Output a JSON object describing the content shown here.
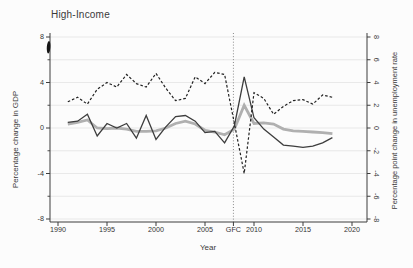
{
  "chart_data": {
    "type": "line",
    "title": "High-Income",
    "xlabel": "Year",
    "ylabel_left": "Percentage change in GDP",
    "ylabel_right": "Percentage point change in unemployment rate",
    "xlim": [
      1989.2,
      2021.5
    ],
    "ylim": [
      -8.4,
      8.4
    ],
    "x_ticks": [
      1990,
      1995,
      2000,
      2005,
      2010,
      2015,
      2020
    ],
    "y_ticks_left_labeled": [
      8,
      4,
      0,
      -4,
      -8
    ],
    "y_ticks_left_minor": [
      6,
      2,
      -2,
      -6
    ],
    "y_ticks_right": [
      8,
      6,
      4,
      2,
      0,
      -2,
      -4,
      -6,
      -8
    ],
    "grid_values": [
      8,
      6,
      4,
      2,
      0,
      -2,
      -4,
      -6,
      -8
    ],
    "grid": "on",
    "legend": "none",
    "event_line": {
      "label": "GFC",
      "x_position": 2007.9,
      "style": "dotted"
    },
    "x": [
      1991,
      1992,
      1993,
      1994,
      1995,
      1996,
      1997,
      1998,
      1999,
      2000,
      2001,
      2002,
      2003,
      2004,
      2005,
      2006,
      2007,
      2008,
      2009,
      2010,
      2011,
      2012,
      2013,
      2014,
      2015,
      2016,
      2017,
      2018
    ],
    "series": [
      {
        "id": "solid-gray-thick",
        "color": "#b0b0b0",
        "width": 2.8,
        "dash": null,
        "values": [
          0.35,
          0.5,
          0.7,
          0.0,
          -0.05,
          0.0,
          -0.1,
          -0.3,
          -0.3,
          -0.25,
          0.0,
          0.4,
          0.6,
          0.35,
          -0.2,
          -0.35,
          -0.6,
          -0.1,
          2.0,
          0.4,
          0.45,
          0.35,
          -0.1,
          -0.25,
          -0.3,
          -0.35,
          -0.4,
          -0.5
        ]
      },
      {
        "id": "solid-dark",
        "color": "#3d3d3d",
        "width": 1.3,
        "dash": null,
        "values": [
          0.5,
          0.6,
          1.2,
          -0.7,
          0.4,
          0.0,
          0.4,
          -0.9,
          1.1,
          -1.0,
          0.1,
          1.0,
          1.1,
          0.6,
          -0.4,
          -0.3,
          -1.3,
          0.2,
          4.5,
          0.9,
          -0.1,
          -0.8,
          -1.5,
          -1.6,
          -1.7,
          -1.6,
          -1.3,
          -0.85
        ]
      },
      {
        "id": "dashed-black",
        "color": "#222222",
        "width": 1.2,
        "dash": "2.6 2",
        "values": [
          2.3,
          2.7,
          2.1,
          3.4,
          4.0,
          3.6,
          4.7,
          3.9,
          3.6,
          4.8,
          3.5,
          2.4,
          2.6,
          4.5,
          3.9,
          4.9,
          4.7,
          0.4,
          -4.0,
          3.1,
          2.6,
          1.2,
          1.9,
          2.4,
          2.5,
          2.1,
          2.9,
          2.7
        ]
      }
    ]
  },
  "artifact": {
    "description": "small black ink mark on left axis below the 8 tick",
    "color": "#151515"
  },
  "colors": {
    "background": "#fcfcfc",
    "grid": "#e3e3e3",
    "axis": "#3c3c3c",
    "text": "#333333",
    "event_line": "#8a8a8a"
  }
}
